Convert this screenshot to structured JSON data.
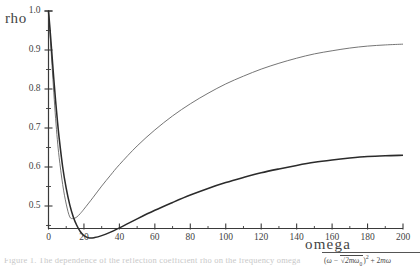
{
  "figure": {
    "kind": "scanned-plot",
    "background_color": "#ffffff",
    "ink_color": "#3a3a3a"
  },
  "axes": {
    "y_label": "rho",
    "x_label": "omega",
    "y_ticks": [
      "1.0",
      "0.9",
      "0.8",
      "0.7",
      "0.6",
      "0.5"
    ],
    "x_ticks": [
      "0",
      "20",
      "40",
      "60",
      "80",
      "100",
      "120",
      "140",
      "160",
      "180",
      "200"
    ]
  },
  "formula": {
    "numerator_fragment": "(ω − √2mω₀)² + 2mω₀",
    "has_radical_bar": true
  },
  "caption": {
    "text": "Figure 1.  The dependence of the reflection coefficient rho on the frequency omega"
  },
  "chart_data": {
    "type": "line",
    "title": "",
    "xlabel": "omega",
    "ylabel": "rho",
    "xlim": [
      0,
      200
    ],
    "ylim": [
      0.4,
      1.0
    ],
    "grid": false,
    "legend": "none",
    "x_major_ticks": [
      0,
      20,
      40,
      60,
      80,
      100,
      120,
      140,
      160,
      180,
      200
    ],
    "x_minor_step": 10,
    "y_major_ticks": [
      0.5,
      0.6,
      0.7,
      0.8,
      0.9,
      1.0
    ],
    "series": [
      {
        "name": "upper-curve",
        "style": "thin-light",
        "color": "#6e6e6e",
        "minimum": {
          "x": 12,
          "y": 0.47
        },
        "endpoint": {
          "x": 200,
          "y": 0.915
        },
        "x": [
          0,
          1,
          2,
          3,
          4,
          5,
          6,
          8,
          10,
          12,
          14,
          16,
          18,
          20,
          25,
          30,
          35,
          40,
          50,
          60,
          70,
          80,
          90,
          100,
          110,
          120,
          130,
          140,
          150,
          160,
          170,
          180,
          190,
          200
        ],
        "y": [
          1.0,
          0.93,
          0.86,
          0.79,
          0.725,
          0.67,
          0.625,
          0.555,
          0.505,
          0.472,
          0.468,
          0.472,
          0.481,
          0.492,
          0.521,
          0.551,
          0.579,
          0.606,
          0.654,
          0.695,
          0.731,
          0.762,
          0.789,
          0.813,
          0.833,
          0.851,
          0.866,
          0.879,
          0.89,
          0.898,
          0.905,
          0.91,
          0.913,
          0.915
        ]
      },
      {
        "name": "lower-curve",
        "style": "thick-dark",
        "color": "#2b2b2b",
        "minimum": {
          "x": 23,
          "y": 0.418
        },
        "endpoint": {
          "x": 200,
          "y": 0.63
        },
        "x": [
          0,
          1,
          2,
          3,
          4,
          5,
          6,
          8,
          10,
          12,
          14,
          16,
          18,
          20,
          23,
          26,
          30,
          35,
          40,
          50,
          60,
          70,
          80,
          90,
          100,
          110,
          120,
          130,
          140,
          150,
          160,
          170,
          180,
          190,
          200
        ],
        "y": [
          1.0,
          0.945,
          0.885,
          0.825,
          0.77,
          0.72,
          0.675,
          0.6,
          0.545,
          0.503,
          0.472,
          0.45,
          0.434,
          0.424,
          0.418,
          0.419,
          0.424,
          0.433,
          0.444,
          0.467,
          0.489,
          0.509,
          0.528,
          0.545,
          0.56,
          0.573,
          0.585,
          0.595,
          0.604,
          0.612,
          0.618,
          0.623,
          0.627,
          0.629,
          0.63
        ]
      }
    ]
  }
}
